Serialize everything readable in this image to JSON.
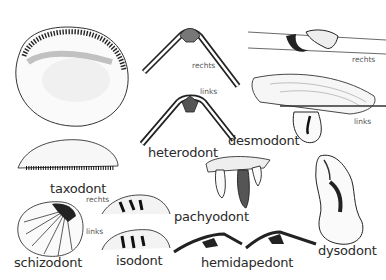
{
  "labels": {
    "heterodont": "heterodont",
    "desmodont": "desmodont",
    "taxodont": "taxodont",
    "schizodont": "schizodont",
    "isodont": "isodont",
    "pachyodont": "pachyodont",
    "hemidapedont": "hemidapedont",
    "dysodont": "dysodont"
  },
  "side_labels": {
    "heterodont_right": "rechts",
    "heterodont_left": "links",
    "desmodont_right": "rechts",
    "desmodont_left": "links",
    "schizodont_right": "rechts",
    "schizodont_left": "links"
  },
  "colors": {
    "ink": "#1a1a1a",
    "text": "#2a2a2a",
    "background": "#ffffff"
  }
}
